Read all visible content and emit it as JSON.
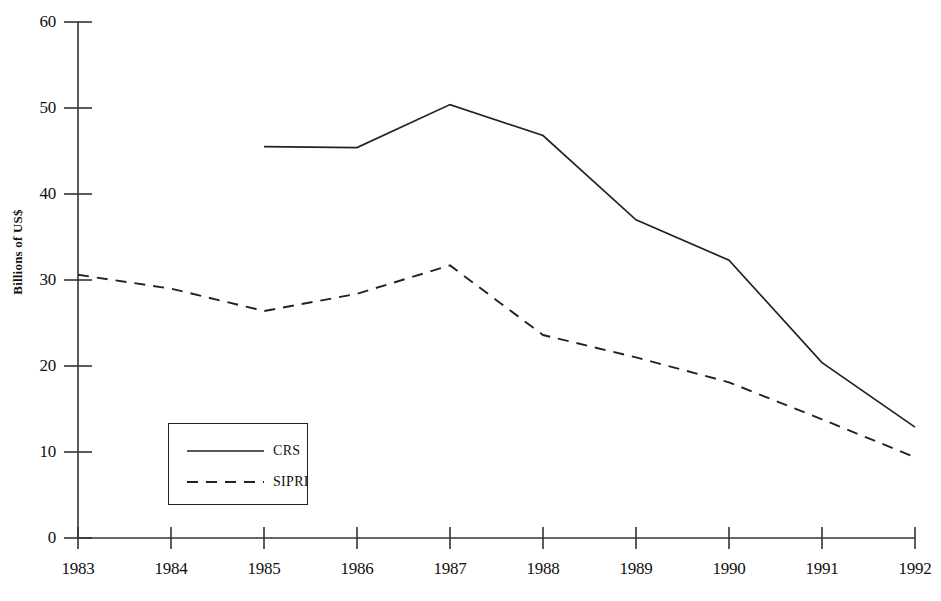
{
  "chart_data": {
    "type": "line",
    "title": "",
    "xlabel": "",
    "ylabel": "Billions of US$",
    "x": [
      1983,
      1984,
      1985,
      1986,
      1987,
      1988,
      1989,
      1990,
      1991,
      1992
    ],
    "xtick_labels": [
      "1983",
      "1984",
      "1985",
      "1986",
      "1987",
      "1988",
      "1989",
      "1990",
      "1991",
      "1992"
    ],
    "ytick_labels": [
      "0",
      "10",
      "20",
      "30",
      "40",
      "50",
      "60"
    ],
    "yticks": [
      0,
      10,
      20,
      30,
      40,
      50,
      60
    ],
    "ylim": [
      0,
      60
    ],
    "xlim": [
      1983,
      1992
    ],
    "grid": false,
    "legend_position": "lower-left-inside",
    "series": [
      {
        "name": "CRS",
        "style": "solid",
        "color": "#222222",
        "x": [
          1985,
          1986,
          1987,
          1988,
          1989,
          1990,
          1991,
          1992
        ],
        "values": [
          45.5,
          45.4,
          50.4,
          46.8,
          37.0,
          32.3,
          20.4,
          12.9
        ]
      },
      {
        "name": "SIPRI",
        "style": "dashed",
        "color": "#222222",
        "x": [
          1983,
          1984,
          1985,
          1986,
          1987,
          1988,
          1989,
          1990,
          1991,
          1992
        ],
        "values": [
          30.6,
          29.0,
          26.4,
          28.4,
          31.7,
          23.6,
          21.0,
          18.1,
          13.8,
          9.4
        ]
      }
    ]
  },
  "axis": {
    "y_label": "Billions of US$",
    "y_ticks": [
      "60",
      "50",
      "40",
      "30",
      "20",
      "10",
      "0"
    ],
    "x_ticks": [
      "1983",
      "1984",
      "1985",
      "1986",
      "1987",
      "1988",
      "1989",
      "1990",
      "1991",
      "1992"
    ]
  },
  "legend": {
    "entries": [
      {
        "label": "CRS",
        "style": "solid"
      },
      {
        "label": "SIPRI",
        "style": "dashed"
      }
    ]
  }
}
